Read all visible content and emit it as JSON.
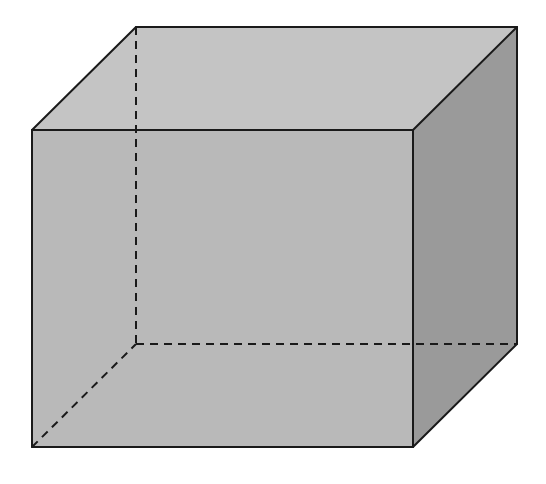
{
  "diagram": {
    "type": "cube-3d-oblique-projection",
    "colors": {
      "background": "#ffffff",
      "top_face": "#c4c4c4",
      "front_face": "#b9b9b9",
      "right_face": "#9a9a9a",
      "edge_line": "#1a1a1a"
    },
    "vertices": {
      "front_top_left": [
        32,
        130
      ],
      "front_top_right": [
        413,
        130
      ],
      "front_bottom_left": [
        32,
        447
      ],
      "front_bottom_right": [
        413,
        447
      ],
      "back_top_left": [
        136,
        27
      ],
      "back_top_right": [
        517,
        27
      ],
      "back_bottom_left": [
        136,
        344
      ],
      "back_bottom_right": [
        517,
        344
      ]
    },
    "faces": [
      {
        "name": "top-face",
        "points": "32,130 136,27 517,27 413,130"
      },
      {
        "name": "front-face",
        "points": "32,130 413,130 413,447 32,447"
      },
      {
        "name": "right-face",
        "points": "413,130 517,27 517,344 413,447"
      }
    ],
    "visible_edges": [
      {
        "name": "front-top-edge",
        "x1": 32,
        "y1": 130,
        "x2": 413,
        "y2": 130
      },
      {
        "name": "front-bottom-edge",
        "x1": 32,
        "y1": 447,
        "x2": 413,
        "y2": 447
      },
      {
        "name": "front-left-edge",
        "x1": 32,
        "y1": 130,
        "x2": 32,
        "y2": 447
      },
      {
        "name": "front-right-edge",
        "x1": 413,
        "y1": 130,
        "x2": 413,
        "y2": 447
      },
      {
        "name": "back-top-edge",
        "x1": 136,
        "y1": 27,
        "x2": 517,
        "y2": 27
      },
      {
        "name": "top-left-depth-edge",
        "x1": 32,
        "y1": 130,
        "x2": 136,
        "y2": 27
      },
      {
        "name": "top-right-depth-edge",
        "x1": 413,
        "y1": 130,
        "x2": 517,
        "y2": 27
      },
      {
        "name": "back-right-edge",
        "x1": 517,
        "y1": 27,
        "x2": 517,
        "y2": 344
      },
      {
        "name": "bottom-right-depth-edge",
        "x1": 413,
        "y1": 447,
        "x2": 517,
        "y2": 344
      }
    ],
    "hidden_edges": [
      {
        "name": "back-left-hidden-edge",
        "x1": 136,
        "y1": 27,
        "x2": 136,
        "y2": 344
      },
      {
        "name": "back-bottom-hidden-edge",
        "x1": 136,
        "y1": 344,
        "x2": 517,
        "y2": 344
      },
      {
        "name": "bottom-left-depth-hidden-edge",
        "x1": 32,
        "y1": 447,
        "x2": 136,
        "y2": 344
      }
    ]
  }
}
